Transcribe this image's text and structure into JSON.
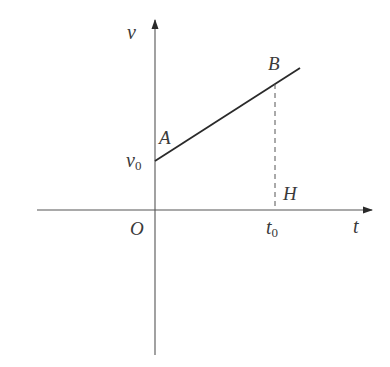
{
  "diagram": {
    "type": "velocity-time graph",
    "axes": {
      "x_label": "t",
      "y_label": "v",
      "origin_label": "O"
    },
    "points": {
      "A": {
        "label": "A"
      },
      "B": {
        "label": "B"
      },
      "H": {
        "label": "H"
      }
    },
    "ticks": {
      "v0": {
        "main": "v",
        "sub": "0"
      },
      "t0": {
        "main": "t",
        "sub": "0"
      }
    },
    "colors": {
      "axis": "#555555",
      "line": "#2a2a2a",
      "text": "#3a3a3a"
    }
  }
}
